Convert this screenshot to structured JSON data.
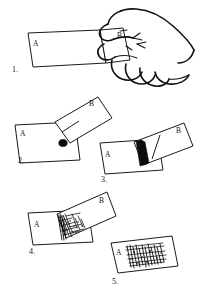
{
  "figure": {
    "background_color": "#ffffff",
    "ink_color": "#141414",
    "style": "black-and-white line art",
    "panel_count": 5
  },
  "panels": [
    {
      "number": "1.",
      "name": "panel-one-hand-holding-cards",
      "card_a_label": "A",
      "card_b_label": "B",
      "description": "Hand holds card B against the right end of card A",
      "has_hand": true,
      "has_dot": false,
      "has_black_band": false,
      "has_scratch": false
    },
    {
      "number": "2.",
      "name": "panel-two-contact-point",
      "card_a_label": "A",
      "card_b_label": "B",
      "description": "Card B tilted up over card A with a black contact dot",
      "has_hand": false,
      "has_dot": true,
      "has_black_band": false,
      "has_scratch": false
    },
    {
      "number": "3.",
      "name": "panel-three-black-band",
      "card_a_label": "A",
      "card_b_label": "B",
      "description": "A thick solid black band forms along the overlap edge",
      "has_hand": false,
      "has_dot": false,
      "has_black_band": true,
      "has_scratch": false
    },
    {
      "number": "4.",
      "name": "panel-four-scratched-overlap",
      "card_a_label": "A",
      "card_b_label": "B",
      "description": "Scratched texture spreads in the overlap region",
      "has_hand": false,
      "has_dot": false,
      "has_black_band": false,
      "has_scratch": true
    },
    {
      "number": "5.",
      "name": "panel-five-result-card",
      "card_a_label": "A",
      "card_b_label": "",
      "description": "Card A alone with a dense scribbled mark across its centre",
      "has_hand": false,
      "has_dot": false,
      "has_black_band": false,
      "has_scratch": true
    }
  ],
  "labels": {
    "a": "A",
    "b": "B",
    "step1": "1.",
    "step2": "2.",
    "step3": "3.",
    "step4": "4.",
    "step5": "5."
  }
}
